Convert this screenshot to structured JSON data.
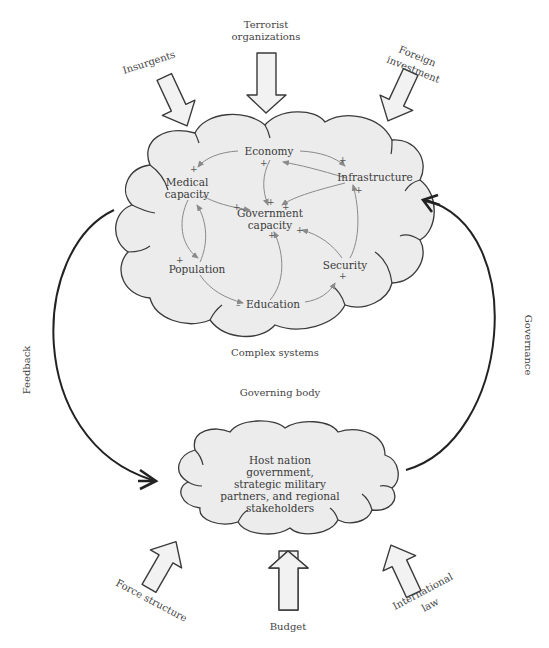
{
  "external_inputs_top": {
    "insurgents": "Insurgents",
    "terrorist_line1": "Terrorist",
    "terrorist_line2": "organizations",
    "foreign_line1": "Foreign",
    "foreign_line2": "investment"
  },
  "complex_system": {
    "caption": "Complex systems",
    "nodes": {
      "economy": "Economy",
      "infrastructure": "Infrastructure",
      "medical_line1": "Medical",
      "medical_line2": "capacity",
      "government_line1": "Government",
      "government_line2": "capacity",
      "population": "Population",
      "security": "Security",
      "education": "Education"
    },
    "signs": {
      "plus": "+",
      "minus": "–"
    }
  },
  "loops": {
    "feedback": "Feedback",
    "governance": "Governance"
  },
  "governing_body": {
    "caption": "Governing body",
    "line1": "Host nation",
    "line2": "government,",
    "line3": "strategic military",
    "line4": "partners, and regional",
    "line5": "stakeholders"
  },
  "external_inputs_bottom": {
    "force_structure": "Force structure",
    "budget": "Budget",
    "international_line1": "International",
    "international_line2": "law"
  },
  "colors": {
    "cloud_fill": "#ececec",
    "outline": "#3a3a3a",
    "link": "#8a8a8a",
    "loop": "#222222"
  }
}
